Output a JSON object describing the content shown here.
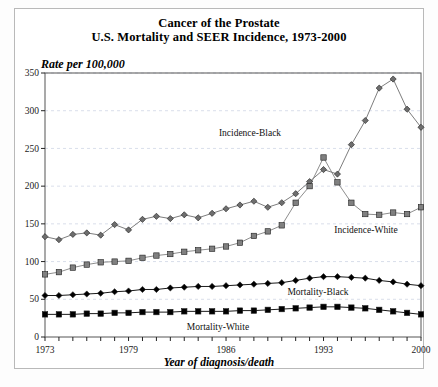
{
  "figure": {
    "title_line1": "Cancer of the Prostate",
    "title_line2": "U.S. Mortality and SEER Incidence, 1973-2000",
    "y_axis_caption": "Rate per 100,000",
    "x_axis_caption": "Year of diagnosis/death"
  },
  "chart_data": {
    "type": "line",
    "xlabel": "Year of diagnosis/death",
    "ylabel": "Rate per 100,000",
    "xlim": [
      1973,
      2000
    ],
    "ylim": [
      0,
      350
    ],
    "yticks": [
      0,
      50,
      100,
      150,
      200,
      250,
      300,
      350
    ],
    "xticks_labeled": [
      1973,
      1979,
      1986,
      1993,
      2000
    ],
    "xticks_all": [
      1973,
      1974,
      1975,
      1976,
      1977,
      1978,
      1979,
      1980,
      1981,
      1982,
      1983,
      1984,
      1985,
      1986,
      1987,
      1988,
      1989,
      1990,
      1991,
      1992,
      1993,
      1994,
      1995,
      1996,
      1997,
      1998,
      1999,
      2000
    ],
    "grid": "horizontal-dashed",
    "legend_position": "inline-annotations",
    "x": [
      1973,
      1974,
      1975,
      1976,
      1977,
      1978,
      1979,
      1980,
      1981,
      1982,
      1983,
      1984,
      1985,
      1986,
      1987,
      1988,
      1989,
      1990,
      1991,
      1992,
      1993,
      1994,
      1995,
      1996,
      1997,
      1998,
      1999,
      2000
    ],
    "series": [
      {
        "name": "Incidence-Black",
        "marker": "diamond",
        "color": "#6e6e6e",
        "label_text": "Incidence-Black",
        "values": [
          133,
          129,
          136,
          138,
          135,
          149,
          142,
          156,
          160,
          157,
          162,
          158,
          164,
          170,
          175,
          180,
          172,
          178,
          190,
          206,
          222,
          216,
          255,
          287,
          330,
          342,
          302,
          278
        ]
      },
      {
        "name": "Incidence-White",
        "marker": "square",
        "color": "#808080",
        "label_text": "Incidence-White",
        "values": [
          83,
          86,
          92,
          96,
          99,
          100,
          101,
          105,
          108,
          110,
          113,
          115,
          117,
          120,
          125,
          134,
          140,
          148,
          178,
          200,
          238,
          205,
          178,
          163,
          162,
          165,
          163,
          172
        ]
      },
      {
        "name": "Mortality-Black",
        "marker": "diamond",
        "color": "#000000",
        "label_text": "Mortality-Black",
        "values": [
          55,
          55,
          56,
          57,
          58,
          60,
          61,
          63,
          63,
          65,
          66,
          67,
          67,
          68,
          69,
          70,
          71,
          72,
          75,
          78,
          80,
          80,
          79,
          78,
          75,
          73,
          70,
          68
        ]
      },
      {
        "name": "Mortality-White",
        "marker": "square",
        "color": "#000000",
        "label_text": "Mortality-White",
        "values": [
          30,
          30,
          30,
          31,
          31,
          32,
          32,
          33,
          33,
          33,
          34,
          34,
          34,
          34,
          35,
          35,
          36,
          37,
          38,
          39,
          40,
          40,
          39,
          38,
          36,
          34,
          32,
          30
        ]
      }
    ]
  }
}
